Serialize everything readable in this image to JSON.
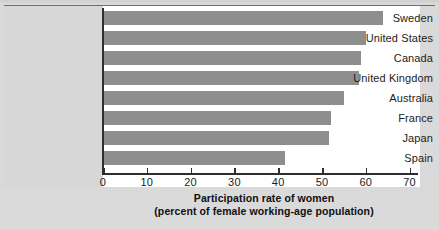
{
  "chart_data": {
    "type": "bar",
    "orientation": "horizontal",
    "title": "",
    "xlabel": "Participation rate of women",
    "xlabel_sub": "(percent of female working-age population)",
    "ylabel": "",
    "categories": [
      "Sweden",
      "United States",
      "Canada",
      "United Kingdom",
      "Australia",
      "France",
      "Japan",
      "Spain"
    ],
    "values": [
      64,
      60,
      59,
      58.5,
      55,
      52,
      51.5,
      41.5
    ],
    "xlim": [
      0,
      73
    ],
    "xticks": [
      0,
      10,
      20,
      30,
      40,
      50,
      60,
      70
    ],
    "xtick_labels": [
      "0",
      "10",
      "20",
      "30",
      "40",
      "50",
      "60",
      "70"
    ],
    "grid": false,
    "legend": null,
    "bar_color": "#8e8e8e",
    "axis_color": "#2d2d2d",
    "plot_background": "#ffffff",
    "panel_background": "#d7d7d7",
    "figure_background": "#d9d9d9"
  },
  "corner": {
    "mark": ""
  }
}
